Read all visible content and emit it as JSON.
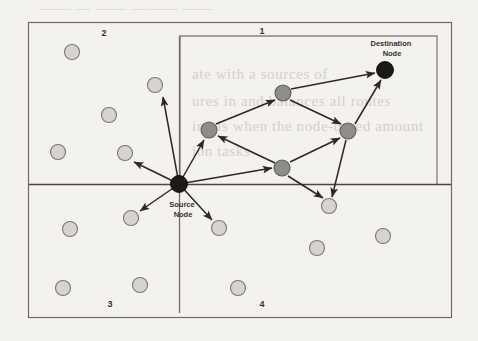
{
  "figure": {
    "background_color": "#f4f2ef",
    "frame": {
      "name": "outer-frame",
      "x": 28,
      "y": 22,
      "width": 424,
      "height": 296,
      "stroke": "#6f6a66"
    },
    "inner_rect": {
      "name": "quadrant-1-region",
      "x": 180,
      "y": 36,
      "width": 257,
      "height": 149,
      "stroke": "#8a8580"
    },
    "axes": {
      "vertical": {
        "x": 179,
        "y1": 36,
        "y2": 313,
        "stroke": "#6f6a66"
      },
      "horizontal": {
        "y": 184,
        "x1": 29,
        "x2": 451,
        "stroke": "#4a4643"
      }
    },
    "quadrant_labels": [
      {
        "id": "quadrant-label-2",
        "text": "2",
        "x": 104,
        "y": 36
      },
      {
        "id": "quadrant-label-1",
        "text": "1",
        "x": 262,
        "y": 34
      },
      {
        "id": "quadrant-label-3",
        "text": "3",
        "x": 110,
        "y": 306
      },
      {
        "id": "quadrant-label-4",
        "text": "4",
        "x": 262,
        "y": 306
      }
    ],
    "node_labels": [
      {
        "id": "source-node-label",
        "lines": [
          "Source",
          "Node"
        ],
        "x": 183,
        "y": 205
      },
      {
        "id": "destination-node-label",
        "lines": [
          "Destination",
          "Node"
        ],
        "x": 385,
        "y": 43
      }
    ],
    "colors": {
      "endpoint_node": "#1c1a19",
      "route_node": "#8f8d8b",
      "idle_node": "#d6d4ce",
      "node_stroke": "#7a7772",
      "arrow": "#2b2825",
      "frame": "#6f6a66",
      "ghost_text": "#cfcac3"
    },
    "nodes": {
      "endpoints": [
        {
          "id": "source-node",
          "label": "Source Node",
          "cx": 179,
          "cy": 184,
          "r": 8.5,
          "kind": "source"
        },
        {
          "id": "destination-node",
          "label": "Destination Node",
          "cx": 385,
          "cy": 70,
          "r": 8.5,
          "kind": "destination"
        }
      ],
      "route": [
        {
          "id": "route-node-a",
          "cx": 209,
          "cy": 130,
          "r": 8
        },
        {
          "id": "route-node-b",
          "cx": 283,
          "cy": 93,
          "r": 8
        },
        {
          "id": "route-node-c",
          "cx": 348,
          "cy": 131,
          "r": 8
        },
        {
          "id": "route-node-d",
          "cx": 282,
          "cy": 168,
          "r": 8
        }
      ],
      "idle": [
        {
          "id": "idle-node-1",
          "cx": 72,
          "cy": 52,
          "r": 7.5
        },
        {
          "id": "idle-node-2",
          "cx": 155,
          "cy": 85,
          "r": 7.5
        },
        {
          "id": "idle-node-3",
          "cx": 109,
          "cy": 115,
          "r": 7.5
        },
        {
          "id": "idle-node-4",
          "cx": 58,
          "cy": 152,
          "r": 7.5
        },
        {
          "id": "idle-node-5",
          "cx": 125,
          "cy": 153,
          "r": 7.5
        },
        {
          "id": "idle-node-6",
          "cx": 131,
          "cy": 218,
          "r": 7.5
        },
        {
          "id": "idle-node-7",
          "cx": 70,
          "cy": 229,
          "r": 7.5
        },
        {
          "id": "idle-node-8",
          "cx": 219,
          "cy": 228,
          "r": 7.5
        },
        {
          "id": "idle-node-9",
          "cx": 329,
          "cy": 206,
          "r": 7.5
        },
        {
          "id": "idle-node-10",
          "cx": 63,
          "cy": 288,
          "r": 7.5
        },
        {
          "id": "idle-node-11",
          "cx": 140,
          "cy": 285,
          "r": 7.5
        },
        {
          "id": "idle-node-12",
          "cx": 238,
          "cy": 288,
          "r": 7.5
        },
        {
          "id": "idle-node-13",
          "cx": 317,
          "cy": 248,
          "r": 7.5
        },
        {
          "id": "idle-node-14",
          "cx": 383,
          "cy": 236,
          "r": 7.5
        }
      ]
    },
    "edges": [
      {
        "id": "edge-source-to-idle5",
        "from": [
          179,
          184
        ],
        "to": [
          133,
          161
        ],
        "arrow": true
      },
      {
        "id": "edge-source-to-idle2",
        "from": [
          179,
          184
        ],
        "to": [
          162,
          96
        ],
        "arrow": true
      },
      {
        "id": "edge-source-to-idle6",
        "from": [
          179,
          184
        ],
        "to": [
          139,
          212
        ],
        "arrow": true
      },
      {
        "id": "edge-source-to-idle8",
        "from": [
          179,
          184
        ],
        "to": [
          213,
          221
        ],
        "arrow": true
      },
      {
        "id": "edge-source-to-routeA",
        "from": [
          179,
          184
        ],
        "to": [
          203,
          139
        ],
        "arrow": true
      },
      {
        "id": "edge-source-to-routeD",
        "from": [
          179,
          184
        ],
        "to": [
          273,
          167
        ],
        "arrow": true
      },
      {
        "id": "edge-routeA-to-routeB",
        "from": [
          216,
          124
        ],
        "to": [
          275,
          100
        ],
        "arrow": true
      },
      {
        "id": "edge-routeD-to-routeA",
        "from": [
          274,
          163
        ],
        "to": [
          217,
          135
        ],
        "arrow": true
      },
      {
        "id": "edge-routeD-to-routeC",
        "from": [
          289,
          162
        ],
        "to": [
          340,
          137
        ],
        "arrow": true
      },
      {
        "id": "edge-routeB-to-routeC",
        "from": [
          290,
          100
        ],
        "to": [
          342,
          124
        ],
        "arrow": true
      },
      {
        "id": "edge-routeB-to-dest",
        "from": [
          291,
          89
        ],
        "to": [
          376,
          73
        ],
        "arrow": true
      },
      {
        "id": "edge-routeC-to-dest",
        "from": [
          355,
          124
        ],
        "to": [
          381,
          79
        ],
        "arrow": true
      },
      {
        "id": "edge-routeD-to-idle9",
        "from": [
          288,
          176
        ],
        "to": [
          323,
          199
        ],
        "arrow": true
      },
      {
        "id": "edge-routeC-to-idle9",
        "from": [
          346,
          140
        ],
        "to": [
          332,
          198
        ],
        "arrow": true
      }
    ],
    "ghost_text": [
      {
        "id": "ghost-line-1",
        "text": "——  —  ——  ———  ——",
        "x": 40,
        "y": 6
      },
      {
        "id": "ghost-line-2",
        "text": "ate  with  a  sources  of",
        "x": 192,
        "y": 74
      },
      {
        "id": "ghost-line-3",
        "text": "ures  in  and  balances  all  routes",
        "x": 192,
        "y": 102
      },
      {
        "id": "ghost-line-4",
        "text": "ing  is  when  the  node-based  amount",
        "x": 192,
        "y": 127
      },
      {
        "id": "ghost-line-5",
        "text": "ion  tasks",
        "x": 192,
        "y": 152
      }
    ]
  }
}
